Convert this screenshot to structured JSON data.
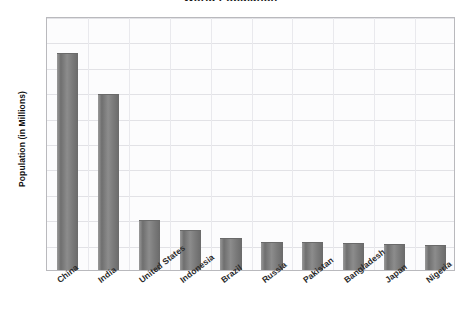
{
  "chart_data": {
    "type": "bar",
    "title": "World Population",
    "xlabel": "",
    "ylabel": "Population (in Millions)",
    "categories": [
      "China",
      "India",
      "United States",
      "Indonesia",
      "Brazil",
      "Russia",
      "Pakistan",
      "Bangladesh",
      "Japan",
      "Nigeria"
    ],
    "values": [
      1275,
      1035,
      290,
      230,
      185,
      160,
      158,
      152,
      148,
      140
    ],
    "ylim": [
      0,
      1500
    ],
    "y_ticks": [
      150,
      300,
      450,
      600,
      750,
      900,
      1050,
      1200,
      1350,
      1500
    ],
    "y_tick_labels": [
      "150",
      "300",
      "450",
      "600",
      "750",
      "900",
      "1,050",
      "1,200",
      "1,350",
      "1,500"
    ],
    "grid": true,
    "legend": false,
    "bar_color": "#7f7f7f",
    "plot_background": "#fcfcfd",
    "gridline_color": "#e2e2e6"
  }
}
